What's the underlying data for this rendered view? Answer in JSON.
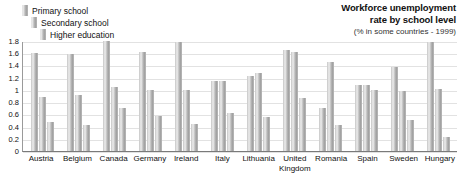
{
  "title": {
    "main": "Workforce unemployment\nrate by school level",
    "sub": "(% in some countries - 1999)"
  },
  "legend": {
    "items": [
      {
        "label": "Primary school",
        "color": "#b4b4b4"
      },
      {
        "label": "Secondary school",
        "color": "#b4b4b4"
      },
      {
        "label": "Higher education",
        "color": "#b4b4b4"
      }
    ]
  },
  "chart_data": {
    "type": "bar",
    "title": "Workforce unemployment rate by school level",
    "subtitle": "(% in some countries - 1999)",
    "xlabel": "",
    "ylabel": "",
    "ylim": [
      0,
      1.8
    ],
    "grid": true,
    "legend_position": "top-left",
    "yticks": [
      "0",
      "0.2",
      "0.4",
      "0.6",
      "0.8",
      "1",
      "1.2",
      "1.4",
      "1.6",
      "1.8"
    ],
    "categories": [
      "Austria",
      "Belgium",
      "Canada",
      "Germany",
      "Ireland",
      "Italy",
      "Lithuania",
      "United\nKingdom",
      "Romania",
      "Spain",
      "Sweden",
      "Hungary"
    ],
    "series": [
      {
        "name": "Primary school",
        "values": [
          1.6,
          1.58,
          1.8,
          1.62,
          1.79,
          1.15,
          1.22,
          1.65,
          0.7,
          1.08,
          1.38,
          1.78
        ]
      },
      {
        "name": "Secondary school",
        "values": [
          0.88,
          0.92,
          1.05,
          1.0,
          1.0,
          1.15,
          1.27,
          1.62,
          1.45,
          1.08,
          0.98,
          1.02
        ]
      },
      {
        "name": "Higher education",
        "values": [
          0.48,
          0.42,
          0.7,
          0.58,
          0.45,
          0.62,
          0.55,
          0.87,
          0.42,
          1.0,
          0.5,
          0.23
        ]
      }
    ]
  }
}
